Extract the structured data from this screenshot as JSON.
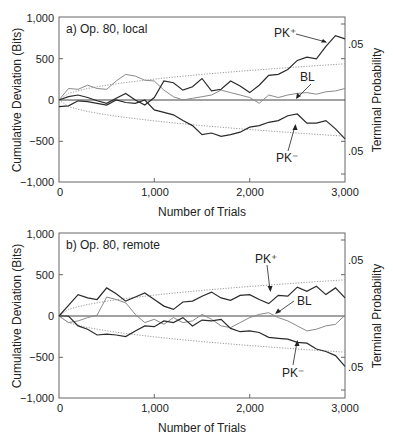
{
  "chart_data": [
    {
      "type": "line",
      "title": "a) Op. 80, local",
      "xlabel": "Number of Trials",
      "ylabel": "Cumulative Deviation (Bits)",
      "ylabel_right": "Terminal Probability",
      "xlim": [
        0,
        3000
      ],
      "ylim": [
        -1000,
        1000
      ],
      "xticks": [
        "0",
        "1,000",
        "2,000",
        "3,000"
      ],
      "yticks": [
        "1,000",
        "500",
        "0",
        "−500",
        "−1,000"
      ],
      "right_ticks": [
        ".05",
        ".05"
      ],
      "grid": false,
      "x": [
        0,
        100,
        200,
        300,
        400,
        500,
        600,
        700,
        800,
        900,
        1000,
        1100,
        1200,
        1300,
        1400,
        1500,
        1600,
        1700,
        1800,
        1900,
        2000,
        2100,
        2200,
        2300,
        2400,
        2500,
        2600,
        2700,
        2800,
        2900,
        3000
      ],
      "series": [
        {
          "name": "PK+",
          "values": [
            0,
            40,
            60,
            30,
            -10,
            -40,
            20,
            80,
            0,
            -60,
            30,
            230,
            210,
            120,
            160,
            260,
            110,
            130,
            230,
            170,
            90,
            180,
            300,
            310,
            370,
            480,
            520,
            500,
            650,
            780,
            740
          ]
        },
        {
          "name": "BL",
          "values": [
            0,
            140,
            130,
            180,
            140,
            130,
            230,
            310,
            290,
            240,
            230,
            120,
            40,
            0,
            20,
            40,
            60,
            120,
            90,
            60,
            30,
            -40,
            60,
            30,
            60,
            80,
            90,
            70,
            100,
            110,
            140
          ]
        },
        {
          "name": "PK−",
          "values": [
            -80,
            -70,
            -10,
            -20,
            -40,
            -60,
            0,
            -30,
            -40,
            0,
            -120,
            -150,
            -180,
            -250,
            -310,
            -420,
            -400,
            -440,
            -420,
            -390,
            -330,
            -310,
            -270,
            -250,
            -190,
            -170,
            -280,
            -280,
            -250,
            -350,
            -470
          ]
        },
        {
          "name": "bound+ (.05)",
          "values": [
            0,
            80,
            113,
            139,
            160,
            179,
            196,
            212,
            226,
            240,
            253,
            265,
            277,
            289,
            299,
            310,
            320,
            330,
            339,
            349,
            358,
            366,
            375,
            384,
            392,
            400,
            408,
            416,
            423,
            431,
            438
          ]
        },
        {
          "name": "bound− (.05)",
          "values": [
            0,
            -80,
            -113,
            -139,
            -160,
            -179,
            -196,
            -212,
            -226,
            -240,
            -253,
            -265,
            -277,
            -289,
            -299,
            -310,
            -320,
            -330,
            -339,
            -349,
            -358,
            -366,
            -375,
            -384,
            -392,
            -400,
            -408,
            -416,
            -423,
            -431,
            -438
          ]
        }
      ],
      "annotations": [
        "PK⁺",
        "BL",
        "PK⁻"
      ]
    },
    {
      "type": "line",
      "title": "b) Op. 80, remote",
      "xlabel": "Number of Trials",
      "ylabel": "Cumulative Deviation (Bits)",
      "ylabel_right": "Terminal Probability",
      "xlim": [
        0,
        3000
      ],
      "ylim": [
        -1000,
        1000
      ],
      "xticks": [
        "0",
        "1,000",
        "2,000",
        "3,000"
      ],
      "yticks": [
        "1,000",
        "500",
        "0",
        "−500",
        "−1,000"
      ],
      "right_ticks": [
        ".05",
        ".05"
      ],
      "grid": false,
      "x": [
        0,
        100,
        200,
        300,
        400,
        500,
        600,
        700,
        800,
        900,
        1000,
        1100,
        1200,
        1300,
        1400,
        1500,
        1600,
        1700,
        1800,
        1900,
        2000,
        2100,
        2200,
        2300,
        2400,
        2500,
        2600,
        2700,
        2800,
        2900,
        3000
      ],
      "series": [
        {
          "name": "PK+",
          "values": [
            0,
            130,
            260,
            220,
            200,
            340,
            270,
            180,
            230,
            280,
            200,
            120,
            80,
            170,
            180,
            240,
            290,
            220,
            190,
            250,
            260,
            200,
            150,
            250,
            240,
            350,
            300,
            360,
            260,
            340,
            220
          ]
        },
        {
          "name": "BL",
          "values": [
            0,
            -80,
            -60,
            -20,
            10,
            230,
            200,
            160,
            20,
            -80,
            -40,
            -100,
            -20,
            -80,
            -60,
            20,
            -40,
            -120,
            -140,
            -80,
            -20,
            20,
            40,
            -20,
            -60,
            -120,
            -180,
            -160,
            -120,
            -100,
            10
          ]
        },
        {
          "name": "PK−",
          "values": [
            0,
            0,
            -120,
            -160,
            -230,
            -220,
            -230,
            -250,
            -180,
            -120,
            -130,
            -60,
            -80,
            -20,
            -120,
            -50,
            -60,
            -40,
            -150,
            -190,
            -180,
            -200,
            -260,
            -270,
            -280,
            -320,
            -330,
            -400,
            -430,
            -480,
            -610
          ]
        },
        {
          "name": "bound+ (.05)",
          "values": [
            0,
            80,
            113,
            139,
            160,
            179,
            196,
            212,
            226,
            240,
            253,
            265,
            277,
            289,
            299,
            310,
            320,
            330,
            339,
            349,
            358,
            366,
            375,
            384,
            392,
            400,
            408,
            416,
            423,
            431,
            438
          ]
        },
        {
          "name": "bound− (.05)",
          "values": [
            0,
            -80,
            -113,
            -139,
            -160,
            -179,
            -196,
            -212,
            -226,
            -240,
            -253,
            -265,
            -277,
            -289,
            -299,
            -310,
            -320,
            -330,
            -339,
            -349,
            -358,
            -366,
            -375,
            -384,
            -392,
            -400,
            -408,
            -416,
            -423,
            -431,
            -438
          ]
        }
      ],
      "annotations": [
        "PK⁺",
        "BL",
        "PK⁻"
      ]
    }
  ],
  "panels": [
    {
      "title": "a) Op. 80, local",
      "xlabel": "Number of Trials",
      "ylabel": "Cumulative Deviation (Bits)",
      "ylabel_right": "Terminal Probability",
      "yticks": [
        "1,000",
        "500",
        "0",
        "−500",
        "−1,000"
      ],
      "xticks": [
        "0",
        "1,000",
        "2,000",
        "3,000"
      ],
      "right_top": ".05",
      "right_bottom": ".05",
      "labels": {
        "pkplus": "PK⁺",
        "bl": "BL",
        "pkminus": "PK⁻"
      }
    },
    {
      "title": "b) Op. 80, remote",
      "xlabel": "Number of Trials",
      "ylabel": "Cumulative Deviation (Bits)",
      "ylabel_right": "Terminal Probability",
      "yticks": [
        "1,000",
        "500",
        "0",
        "−500",
        "−1,000"
      ],
      "xticks": [
        "0",
        "1,000",
        "2,000",
        "3,000"
      ],
      "right_top": ".05",
      "right_bottom": ".05",
      "labels": {
        "pkplus": "PK⁺",
        "bl": "BL",
        "pkminus": "PK⁻"
      }
    }
  ],
  "colors": {
    "pk_line": "#2a2a2a",
    "bl_line": "#8a8a8a",
    "bound": "#9a9a9a",
    "frame": "#555555",
    "text": "#222222"
  }
}
